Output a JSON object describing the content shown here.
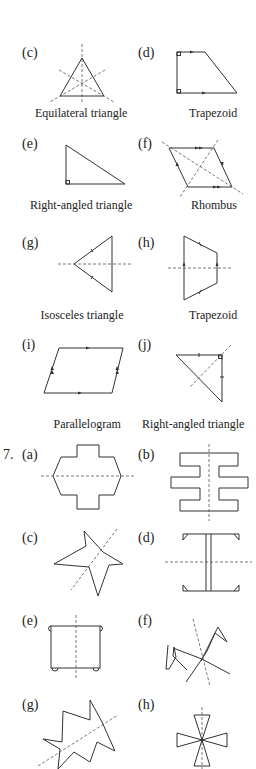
{
  "question6": {
    "items": [
      {
        "label": "(c)",
        "caption": "Equilateral triangle"
      },
      {
        "label": "(d)",
        "caption": "Trapezoid"
      },
      {
        "label": "(e)",
        "caption": "Right-angled triangle"
      },
      {
        "label": "(f)",
        "caption": "Rhombus"
      },
      {
        "label": "(g)",
        "caption": "Isosceles triangle"
      },
      {
        "label": "(h)",
        "caption": "Trapezoid"
      },
      {
        "label": "(i)",
        "caption": "Parallelogram"
      },
      {
        "label": "(j)",
        "caption": "Right-angled triangle"
      }
    ]
  },
  "question7": {
    "number": "7.",
    "items": [
      {
        "label": "(a)"
      },
      {
        "label": "(b)"
      },
      {
        "label": "(c)"
      },
      {
        "label": "(d)"
      },
      {
        "label": "(e)"
      },
      {
        "label": "(f)"
      },
      {
        "label": "(g)"
      },
      {
        "label": "(h)"
      }
    ]
  }
}
